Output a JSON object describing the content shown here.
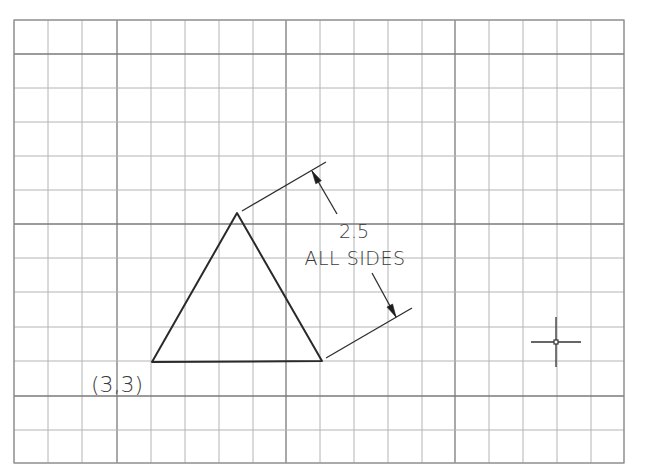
{
  "drawing": {
    "type": "cad-grid-drawing",
    "background": "#ffffff",
    "grid": {
      "left": 14,
      "top": 20,
      "right": 624,
      "bottom": 463,
      "x_lines": [
        14,
        48,
        82,
        117,
        151,
        185,
        219,
        253,
        286,
        320,
        354,
        388,
        422,
        455,
        489,
        523,
        557,
        591,
        624
      ],
      "y_lines": [
        20,
        54,
        88,
        122,
        156,
        190,
        224,
        258,
        292,
        327,
        361,
        396,
        430,
        463
      ],
      "major_x_indices": [
        3,
        8,
        13
      ],
      "major_y_indices": [
        1,
        6,
        11
      ],
      "minor_color": "#b4b4b4",
      "major_color": "#7a7a7a"
    },
    "triangle": {
      "name": "equilateral-triangle",
      "vertices": [
        [
          152,
          362
        ],
        [
          322,
          361
        ],
        [
          237,
          213
        ]
      ],
      "color": "#2a2a2a"
    },
    "start_point_label": {
      "text": "(3,3)",
      "x": 91,
      "y": 392
    },
    "dimension": {
      "value_text": "2.5",
      "note_text": "ALL SIDES",
      "value_pos": [
        354,
        238
      ],
      "note_pos": [
        355,
        265
      ],
      "extension_lines": [
        [
          [
            242,
            211
          ],
          [
            326,
            162
          ]
        ],
        [
          [
            326,
            358
          ],
          [
            412,
            308
          ]
        ]
      ],
      "leader_lines": [
        [
          [
            312,
            171
          ],
          [
            337,
            214
          ]
        ],
        [
          [
            372,
            273
          ],
          [
            396,
            317
          ]
        ]
      ],
      "arrow_tips": [
        {
          "tip": [
            312,
            171
          ],
          "dir": [
            25,
            43
          ]
        },
        {
          "tip": [
            396,
            317
          ],
          "dir": [
            -24,
            -44
          ]
        }
      ]
    },
    "cursor": {
      "name": "crosshair-cursor",
      "center": [
        556,
        342
      ],
      "arm_h": 25,
      "arm_v": 25,
      "box": 4
    }
  }
}
